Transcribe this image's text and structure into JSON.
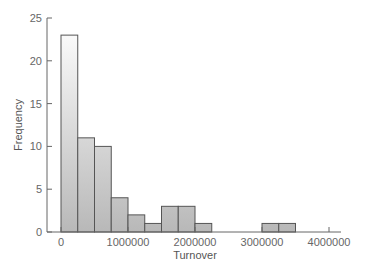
{
  "chart_data": {
    "type": "bar",
    "subtype": "histogram",
    "title": "",
    "xlabel": "Turnover",
    "ylabel": "Frequency",
    "xlim": [
      0,
      4000000
    ],
    "ylim": [
      0,
      25
    ],
    "bin_width": 250000,
    "bins": [
      {
        "start": 0,
        "end": 250000,
        "count": 23
      },
      {
        "start": 250000,
        "end": 500000,
        "count": 11
      },
      {
        "start": 500000,
        "end": 750000,
        "count": 10
      },
      {
        "start": 750000,
        "end": 1000000,
        "count": 4
      },
      {
        "start": 1000000,
        "end": 1250000,
        "count": 2
      },
      {
        "start": 1250000,
        "end": 1500000,
        "count": 1
      },
      {
        "start": 1500000,
        "end": 1750000,
        "count": 3
      },
      {
        "start": 1750000,
        "end": 2000000,
        "count": 3
      },
      {
        "start": 2000000,
        "end": 2250000,
        "count": 1
      },
      {
        "start": 3000000,
        "end": 3250000,
        "count": 1
      },
      {
        "start": 3250000,
        "end": 3500000,
        "count": 1
      }
    ],
    "x_ticks": [
      {
        "value": 0,
        "label": "0"
      },
      {
        "value": 1000000,
        "label": "1000000"
      },
      {
        "value": 2000000,
        "label": "2000000"
      },
      {
        "value": 3000000,
        "label": "3000000"
      },
      {
        "value": 4000000,
        "label": "4000000"
      }
    ],
    "y_ticks": [
      {
        "value": 0,
        "label": "0"
      },
      {
        "value": 5,
        "label": "5"
      },
      {
        "value": 10,
        "label": "10"
      },
      {
        "value": 15,
        "label": "15"
      },
      {
        "value": 20,
        "label": "20"
      },
      {
        "value": 25,
        "label": "25"
      }
    ],
    "grid": false,
    "legend": null,
    "colors": {
      "bar_top": "#ffffff",
      "bar_bottom": "#b8b8b8",
      "bar_stroke": "#555555",
      "axis": "#666666"
    }
  }
}
